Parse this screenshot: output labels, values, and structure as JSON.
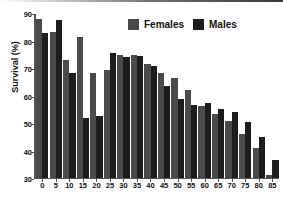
{
  "chart_data": {
    "type": "bar",
    "title": "",
    "xlabel": "",
    "ylabel": "Survival (%)",
    "ylim": [
      30,
      90
    ],
    "yticks": [
      30,
      40,
      50,
      60,
      70,
      80,
      90
    ],
    "grid": false,
    "legend_position": "top-center",
    "categories": [
      "0",
      "5",
      "10",
      "15",
      "20",
      "25",
      "30",
      "35",
      "40",
      "45",
      "50",
      "55",
      "60",
      "65",
      "70",
      "75",
      "80",
      "85"
    ],
    "series": [
      {
        "name": "Females",
        "color": "#4a4a4a",
        "values": [
          88.3,
          83.4,
          73.2,
          81.6,
          68.3,
          69.7,
          75.0,
          75.0,
          71.8,
          68.6,
          66.6,
          62.3,
          56.3,
          53.4,
          50.7,
          46.0,
          40.7,
          31.0
        ]
      },
      {
        "name": "Males",
        "color": "#1d1d1d",
        "values": [
          83.1,
          87.8,
          68.5,
          51.8,
          52.7,
          75.7,
          74.4,
          74.8,
          71.2,
          63.8,
          58.9,
          56.6,
          57.3,
          55.1,
          54.0,
          50.5,
          45.0,
          36.6
        ]
      }
    ]
  },
  "legend": {
    "females_label": "Females",
    "males_label": "Males"
  },
  "axis": {
    "y_title": "Survival (%)"
  }
}
